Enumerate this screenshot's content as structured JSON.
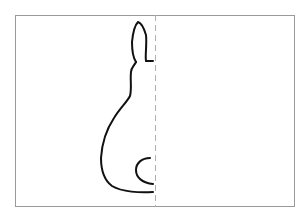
{
  "worksheet": {
    "subject": "rabbit-half-outline",
    "frame": {
      "border_color": "#9a9a9a",
      "background": "#ffffff"
    },
    "symmetry_line": {
      "style": "dashed",
      "color": "#b0b0b0"
    },
    "outline": {
      "color": "#111111"
    }
  }
}
